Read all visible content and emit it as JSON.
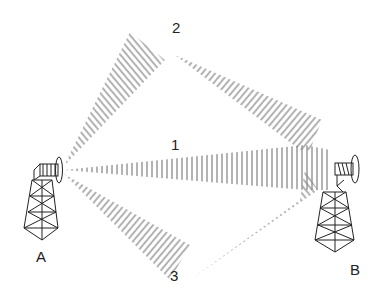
{
  "diagram": {
    "paths": [
      {
        "id": "1",
        "label": "1",
        "description": "direct path"
      },
      {
        "id": "2",
        "label": "2",
        "description": "upper reflected path"
      },
      {
        "id": "3",
        "label": "3",
        "description": "lower reflected path"
      }
    ],
    "towers": [
      {
        "id": "A",
        "label": "A"
      },
      {
        "id": "B",
        "label": "B"
      }
    ],
    "colors": {
      "hatch": "#8a8a8a",
      "tower": "#222222",
      "text": "#222222"
    }
  }
}
